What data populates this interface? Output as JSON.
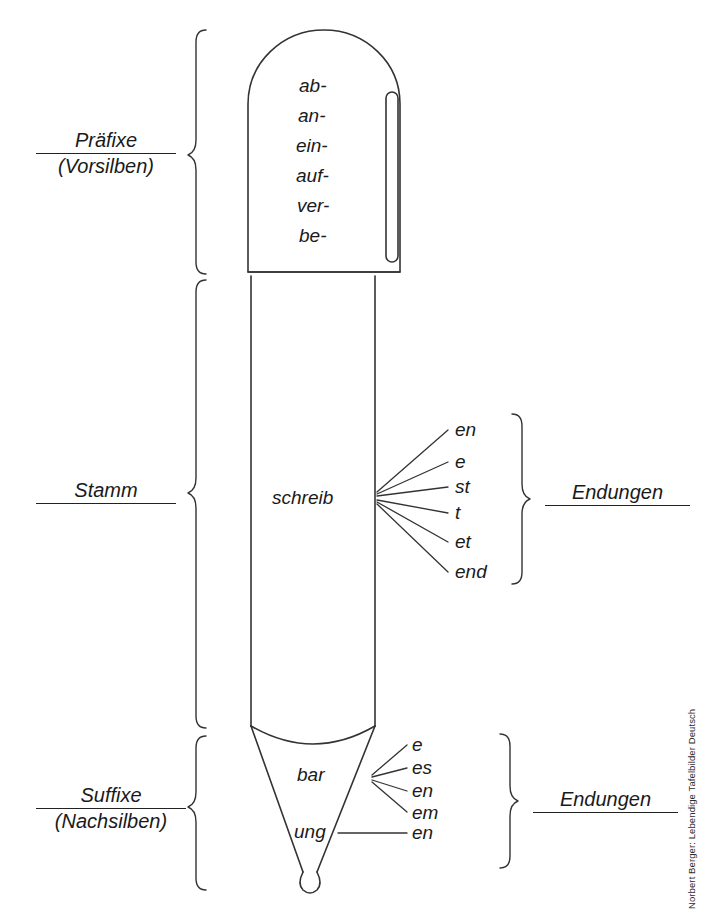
{
  "figure": {
    "title_alt": "Wortbausteine am Bleistift: Praefixe, Stamm, Suffixe, Endungen",
    "credit": "Norbert Berger: Lebendige Tafelbilder Deutsch"
  },
  "left_labels": [
    {
      "name": "praefixe",
      "line1": "Präfixe",
      "line2": "(Vorsilben)"
    },
    {
      "name": "stamm",
      "line1": "Stamm",
      "line2": ""
    },
    {
      "name": "suffixe",
      "line1": "Suffixe",
      "line2": "(Nachsilben)"
    }
  ],
  "right_labels": [
    {
      "name": "endungen-stamm",
      "line1": "Endungen"
    },
    {
      "name": "endungen-suffix",
      "line1": "Endungen"
    }
  ],
  "prefixes": [
    "ab-",
    "an-",
    "ein-",
    "auf-",
    "ver-",
    "be-"
  ],
  "stem": "schreib",
  "stem_endings": [
    "en",
    "e",
    "st",
    "t",
    "et",
    "end"
  ],
  "suffixes": [
    {
      "morpheme": "bar",
      "endings": [
        "e",
        "es",
        "en",
        "em"
      ]
    },
    {
      "morpheme": "ung",
      "endings": [
        "en"
      ]
    }
  ],
  "colors": {
    "ink": "#1a1a1a",
    "stroke": "#333333",
    "paper": "#ffffff"
  }
}
